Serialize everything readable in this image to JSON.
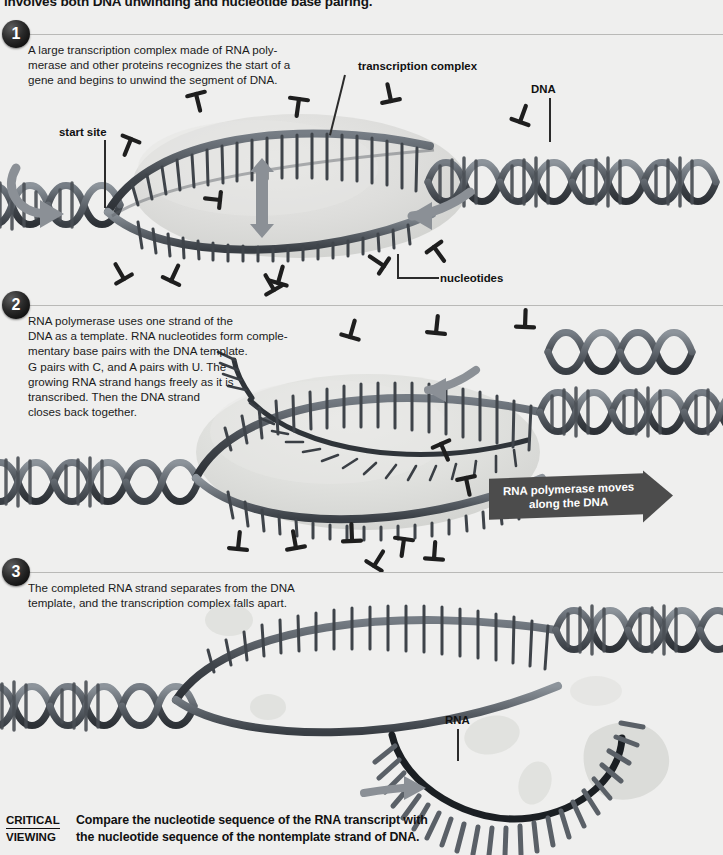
{
  "page": {
    "background_color": "#efefee",
    "top_heading_truncated": "involves both DNA unwinding and nucleotide base pairing.",
    "watermark": "CHAPTER 9  ·  THE CHEMISTRY OF LIFE"
  },
  "steps": [
    {
      "number": "1",
      "text": "A large transcription complex made of RNA poly-\nmerase and other proteins recognizes the start of a\ngene and begins to unwind the segment of DNA."
    },
    {
      "number": "2",
      "text": "RNA polymerase uses one strand of the\nDNA as a template. RNA nucleotides form comple-\nmentary base pairs with the DNA template.\nG pairs with C, and A pairs with U. The\ngrowing RNA strand hangs freely as it is\ntranscribed. Then the DNA strand\ncloses back together."
    },
    {
      "number": "3",
      "text": "The completed RNA strand separates from the DNA\ntemplate, and the transcription complex falls apart."
    }
  ],
  "labels": {
    "start_site": "start site",
    "transcription_complex": "transcription complex",
    "dna": "DNA",
    "nucleotides": "nucleotides",
    "rna": "RNA"
  },
  "banner": {
    "text": "RNA polymerase moves\nalong the DNA",
    "fill_color": "#4c4c4c",
    "text_color": "#ffffff"
  },
  "critical_viewing": {
    "tag_line1": "CRITICAL",
    "tag_line2": "VIEWING",
    "question": "Compare the nucleotide sequence of the RNA transcript with\nthe nucleotide sequence of the nontemplate strand of DNA."
  },
  "colors": {
    "dna_strand_dark": "#3a3f45",
    "dna_strand_mid": "#6b727a",
    "rung": "#4a4f55",
    "complex_blob": "#d7d8d6",
    "rule": "#b9b9b7",
    "text": "#1b1b1b",
    "badge": "#101010",
    "arrow_gray": "#8b9096"
  },
  "artwork": {
    "description": "Three-stage transcription diagram: DNA double helix with unwound transcription bubble, RNA polymerase complex shown as a pale gray blob, free nucleotides drawn as small dark T-shaped / pin shapes scattered across the field, and a growing RNA strand with comb-like bases.",
    "stage1_bubble_center": [
      300,
      185
    ],
    "stage2_bubble_center": [
      360,
      450
    ],
    "stage3_bubble_center": [
      400,
      660
    ],
    "free_nucleotide_count": 18
  }
}
